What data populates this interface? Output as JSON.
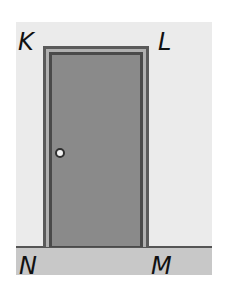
{
  "diagram": {
    "vertices": {
      "top_left": "K",
      "top_right": "L",
      "bottom_right": "M",
      "bottom_left": "N"
    },
    "colors": {
      "background": "#ebebeb",
      "floor": "#c8c8c8",
      "door": "#8a8a8a",
      "frame": "#5a5a5a",
      "knob": "#f2f2f2"
    }
  }
}
